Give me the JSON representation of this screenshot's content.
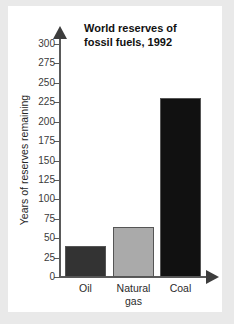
{
  "figure": {
    "background_color": "#ffffff",
    "page_color": "#e9e9e9"
  },
  "chart_data": {
    "type": "bar",
    "title": "World reserves of fossil fuels, 1992",
    "title_line1": "World reserves of",
    "title_line2": "fossil fuels, 1992",
    "xlabel": "",
    "ylabel": "Years of reserves remaining",
    "categories": [
      "Oil",
      "Natural gas",
      "Coal"
    ],
    "category_labels": [
      {
        "line1": "Oil",
        "line2": ""
      },
      {
        "line1": "Natural",
        "line2": "gas"
      },
      {
        "line1": "Coal",
        "line2": ""
      }
    ],
    "values": [
      40,
      64,
      230
    ],
    "bar_colors": [
      "#333333",
      "#aaaaaa",
      "#111111"
    ],
    "bar_edge_color": "#555555",
    "ylim": [
      0,
      300
    ],
    "yticks": [
      0,
      25,
      50,
      75,
      100,
      125,
      150,
      175,
      200,
      225,
      250,
      275,
      300
    ],
    "ytick_labels": [
      "0",
      "25",
      "50",
      "75",
      "100",
      "125",
      "150",
      "175",
      "200",
      "225",
      "250",
      "275",
      "300"
    ],
    "grid": false,
    "legend": false,
    "axis_color": "#5a5a5a",
    "axis_arrows": true
  }
}
